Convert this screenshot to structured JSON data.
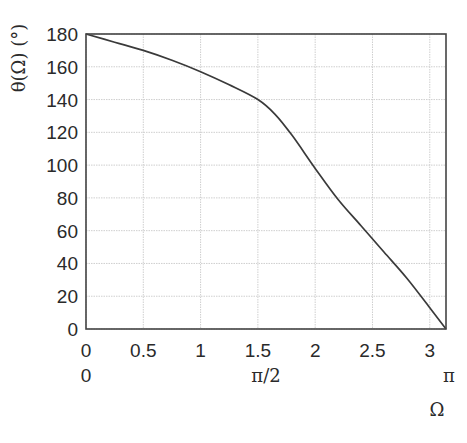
{
  "chart_data": {
    "type": "line",
    "title": "",
    "xlabel": "Ω",
    "ylabel": "θ(Ω) (°)",
    "xlim": [
      0,
      3.14159
    ],
    "ylim": [
      0,
      180
    ],
    "grid": true,
    "legend": null,
    "x_ticks": [
      "0",
      "0.5",
      "1",
      "1.5",
      "2",
      "2.5",
      "3"
    ],
    "x_tick_values": [
      0,
      0.5,
      1,
      1.5,
      2,
      2.5,
      3
    ],
    "x_ticks_secondary": [
      {
        "value": 0,
        "label": "0"
      },
      {
        "value": 1.5708,
        "label": "π/2"
      },
      {
        "value": 3.14159,
        "label": "π"
      }
    ],
    "y_ticks": [
      "0",
      "20",
      "40",
      "60",
      "80",
      "100",
      "120",
      "140",
      "160",
      "180"
    ],
    "y_tick_values": [
      0,
      20,
      40,
      60,
      80,
      100,
      120,
      140,
      160,
      180
    ],
    "series": [
      {
        "name": "θ(Ω)",
        "x": [
          0,
          0.25,
          0.5,
          0.75,
          1.0,
          1.25,
          1.5,
          1.65,
          1.8,
          2.0,
          2.2,
          2.4,
          2.6,
          2.8,
          3.0,
          3.14159
        ],
        "y": [
          180,
          175,
          170,
          164,
          157,
          149,
          140,
          131,
          118,
          98,
          79,
          63,
          47,
          31,
          13,
          0
        ]
      }
    ]
  }
}
